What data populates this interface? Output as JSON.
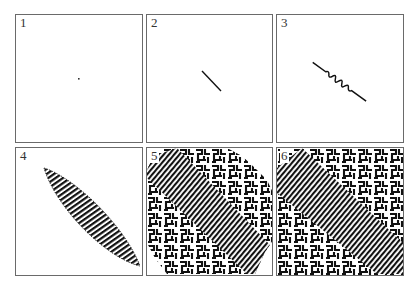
{
  "figure": {
    "panels": [
      {
        "label": "1",
        "stage": "seed dot"
      },
      {
        "label": "2",
        "stage": "diagonal line"
      },
      {
        "label": "3",
        "stage": "line with undulating stripes at center"
      },
      {
        "label": "4",
        "stage": "lens-shaped stripe domain"
      },
      {
        "label": "5",
        "stage": "labyrinth filling most of panel"
      },
      {
        "label": "6",
        "stage": "labyrinth filling entire panel"
      }
    ],
    "colors": {
      "ink": "#111111",
      "border": "#6a6a6a",
      "background": "#ffffff"
    }
  }
}
